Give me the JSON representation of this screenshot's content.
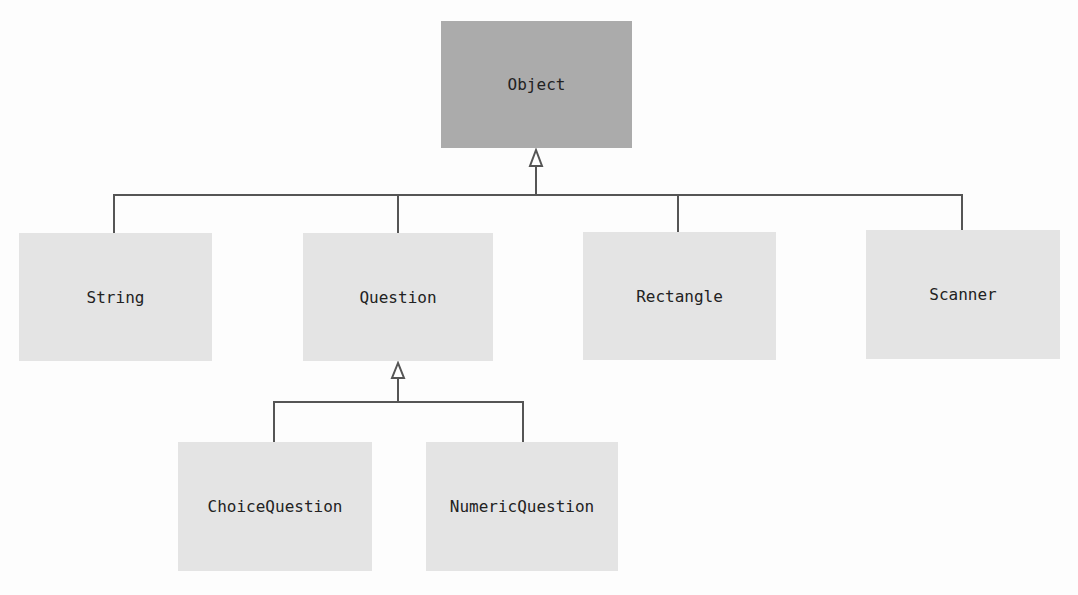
{
  "diagram": {
    "type": "uml-class-hierarchy",
    "root": {
      "label": "Object"
    },
    "level1": [
      {
        "label": "String"
      },
      {
        "label": "Question"
      },
      {
        "label": "Rectangle"
      },
      {
        "label": "Scanner"
      }
    ],
    "level2": [
      {
        "label": "ChoiceQuestion"
      },
      {
        "label": "NumericQuestion"
      }
    ],
    "relations": [
      {
        "from": "String",
        "to": "Object",
        "kind": "inheritance"
      },
      {
        "from": "Question",
        "to": "Object",
        "kind": "inheritance"
      },
      {
        "from": "Rectangle",
        "to": "Object",
        "kind": "inheritance"
      },
      {
        "from": "Scanner",
        "to": "Object",
        "kind": "inheritance"
      },
      {
        "from": "ChoiceQuestion",
        "to": "Question",
        "kind": "inheritance"
      },
      {
        "from": "NumericQuestion",
        "to": "Question",
        "kind": "inheritance"
      }
    ],
    "colors": {
      "root_fill": "#ababab",
      "node_fill": "#e4e4e4",
      "line": "#555555"
    }
  }
}
